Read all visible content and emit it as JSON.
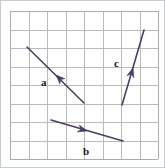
{
  "figure": {
    "background_color": "#ffffff",
    "border_color": "#c9cacc",
    "grid": {
      "columns": 8,
      "rows": 8,
      "x_start": 10,
      "y_start": 11,
      "cell_size": 18.5,
      "line_color": "#b9babc",
      "visible": true
    },
    "vector_color": "#4a3d68",
    "label_color": "#17171a",
    "vectors": [
      {
        "name": "a",
        "label": "a",
        "tail_x": 84,
        "tail_y": 103,
        "tip_x": 27,
        "tip_y": 47,
        "arrowhead_position": "midpoint",
        "arrow_at_x": 56,
        "arrow_at_y": 75,
        "direction": "up-left",
        "label_x": 41,
        "label_y": 86,
        "grid_components_x": -3,
        "grid_components_y": 3
      },
      {
        "name": "b",
        "label": "b",
        "tail_x": 51,
        "tail_y": 120,
        "tip_x": 123,
        "tip_y": 141,
        "arrowhead_position": "midpoint",
        "arrow_at_x": 87,
        "arrow_at_y": 131,
        "direction": "right-down",
        "label_x": 83,
        "label_y": 155,
        "grid_components_x": 4,
        "grid_components_y": -1
      },
      {
        "name": "c",
        "label": "c",
        "tail_x": 122,
        "tail_y": 105,
        "tip_x": 144,
        "tip_y": 30,
        "arrowhead_position": "midpoint",
        "arrow_at_x": 133,
        "arrow_at_y": 68,
        "direction": "up-right",
        "label_x": 114,
        "label_y": 67,
        "grid_components_x": 1,
        "grid_components_y": 4
      }
    ]
  }
}
